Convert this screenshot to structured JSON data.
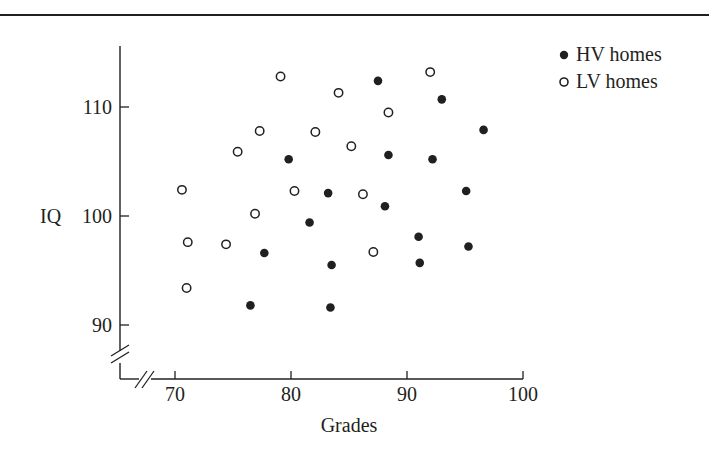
{
  "chart_data": {
    "type": "scatter",
    "title": "",
    "xlabel": "Grades",
    "ylabel": "IQ",
    "xlim": [
      65,
      100
    ],
    "ylim": [
      85,
      116
    ],
    "x_ticks": [
      70,
      80,
      90,
      100
    ],
    "y_ticks": [
      90,
      100,
      110
    ],
    "x_tick_labels": [
      "70",
      "80",
      "90",
      "100"
    ],
    "y_tick_labels": [
      "90",
      "100",
      "110"
    ],
    "axis_breaks": {
      "x": true,
      "y": true
    },
    "grid": false,
    "legend_position": "top-right",
    "series": [
      {
        "name": "HV homes",
        "marker": "filled-circle",
        "points": [
          [
            87.5,
            112.4
          ],
          [
            93.0,
            110.7
          ],
          [
            96.6,
            107.9
          ],
          [
            79.8,
            105.2
          ],
          [
            88.4,
            105.6
          ],
          [
            92.2,
            105.2
          ],
          [
            83.2,
            102.1
          ],
          [
            95.1,
            102.3
          ],
          [
            88.1,
            100.9
          ],
          [
            81.6,
            99.4
          ],
          [
            91.0,
            98.1
          ],
          [
            95.3,
            97.2
          ],
          [
            77.7,
            96.6
          ],
          [
            83.5,
            95.5
          ],
          [
            91.1,
            95.7
          ],
          [
            76.5,
            91.8
          ],
          [
            83.4,
            91.6
          ]
        ]
      },
      {
        "name": "LV homes",
        "marker": "open-circle",
        "points": [
          [
            79.1,
            112.8
          ],
          [
            92.0,
            113.2
          ],
          [
            84.1,
            111.3
          ],
          [
            88.4,
            109.5
          ],
          [
            77.3,
            107.8
          ],
          [
            82.1,
            107.7
          ],
          [
            75.4,
            105.9
          ],
          [
            85.2,
            106.4
          ],
          [
            70.6,
            102.4
          ],
          [
            80.3,
            102.3
          ],
          [
            86.2,
            102.0
          ],
          [
            76.9,
            100.2
          ],
          [
            71.1,
            97.6
          ],
          [
            74.4,
            97.4
          ],
          [
            87.1,
            96.7
          ],
          [
            71.0,
            93.4
          ]
        ]
      }
    ]
  },
  "legend": {
    "items": [
      {
        "label": "HV homes",
        "marker": "filled-circle-icon"
      },
      {
        "label": "LV homes",
        "marker": "open-circle-icon"
      }
    ]
  },
  "colors": {
    "ink": "#231f20",
    "background": "#ffffff"
  }
}
